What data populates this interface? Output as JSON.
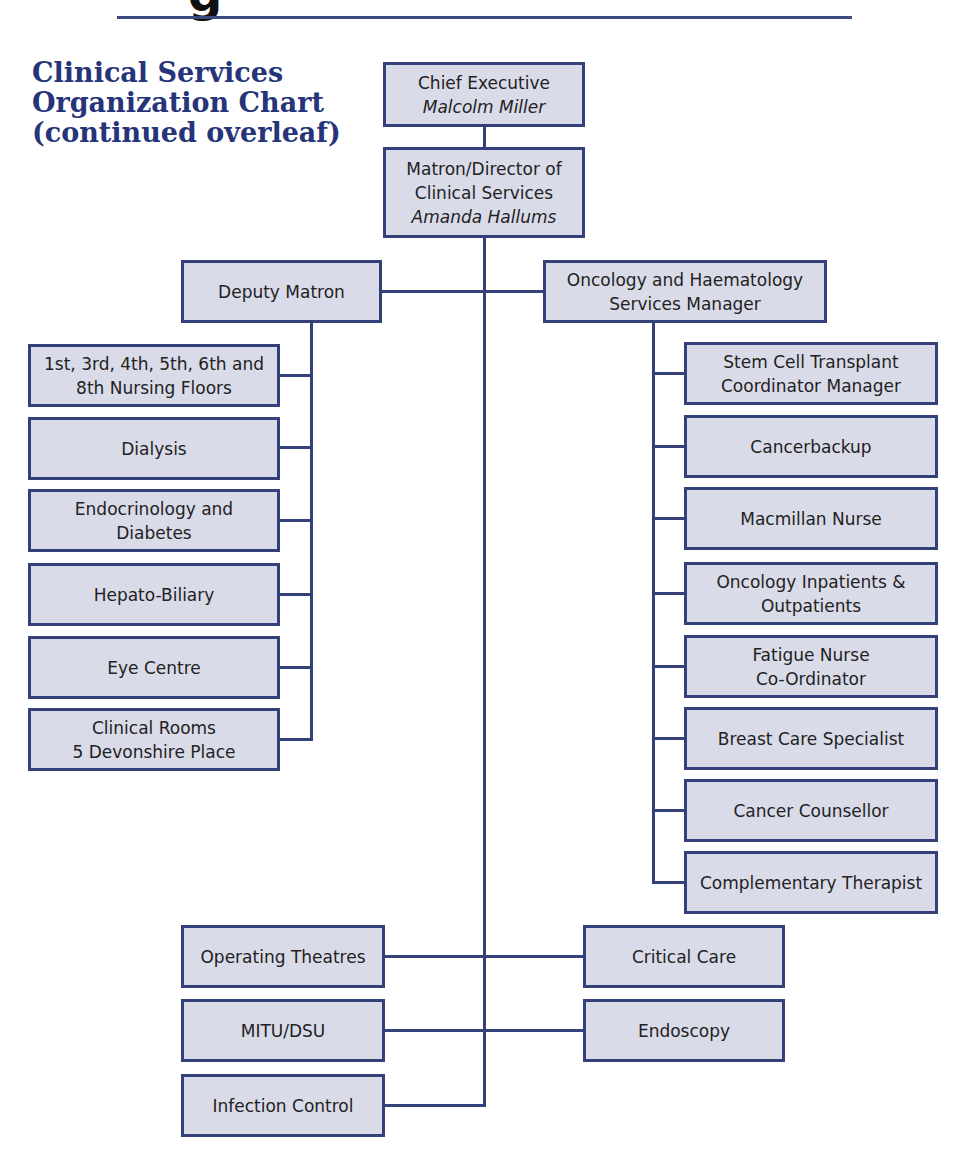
{
  "header": {
    "partial_glyph": "g",
    "title": "Clinical Services Organization Chart (continued overleaf)"
  },
  "colors": {
    "accent": "#263479",
    "box_border": "#33407a",
    "box_fill": "#dadbe9",
    "text": "#222222"
  },
  "chart": {
    "chief": {
      "role": "Chief Executive",
      "name": "Malcolm Miller"
    },
    "matron": {
      "role_line1": "Matron/Director of",
      "role_line2": "Clinical Services",
      "name": "Amanda Hallums"
    },
    "deputy": {
      "label": "Deputy Matron"
    },
    "oncology": {
      "line1": "Oncology and Haematology",
      "line2": "Services Manager"
    },
    "deputy_reports": [
      {
        "line1": "1st, 3rd, 4th, 5th, 6th and",
        "line2": "8th Nursing Floors"
      },
      {
        "line1": "Dialysis",
        "line2": ""
      },
      {
        "line1": "Endocrinology and",
        "line2": "Diabetes"
      },
      {
        "line1": "Hepato-Biliary",
        "line2": ""
      },
      {
        "line1": "Eye Centre",
        "line2": ""
      },
      {
        "line1": "Clinical Rooms",
        "line2": "5 Devonshire Place"
      }
    ],
    "oncology_reports": [
      {
        "line1": "Stem Cell Transplant",
        "line2": "Coordinator Manager"
      },
      {
        "line1": "Cancerbackup",
        "line2": ""
      },
      {
        "line1": "Macmillan Nurse",
        "line2": ""
      },
      {
        "line1": "Oncology Inpatients &",
        "line2": "Outpatients"
      },
      {
        "line1": "Fatigue Nurse",
        "line2": "Co-Ordinator"
      },
      {
        "line1": "Breast Care Specialist",
        "line2": ""
      },
      {
        "line1": "Cancer Counsellor",
        "line2": ""
      },
      {
        "line1": "Complementary Therapist",
        "line2": ""
      }
    ],
    "bottom_left": [
      {
        "label": "Operating Theatres"
      },
      {
        "label": "MITU/DSU"
      },
      {
        "label": "Infection Control"
      }
    ],
    "bottom_right": [
      {
        "label": "Critical Care"
      },
      {
        "label": "Endoscopy"
      }
    ]
  }
}
